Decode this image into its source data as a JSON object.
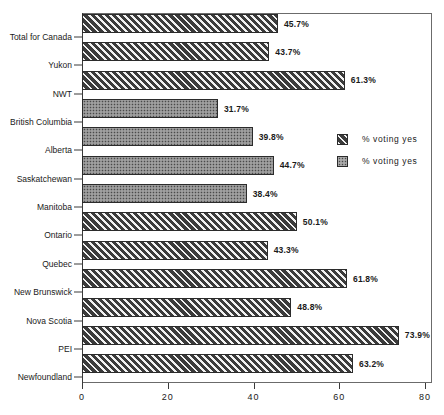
{
  "chart_data": {
    "type": "bar",
    "orientation": "horizontal",
    "title": "",
    "xlabel": "",
    "ylabel": "",
    "xlim": [
      0,
      80
    ],
    "xticks": [
      0,
      20,
      40,
      60,
      80
    ],
    "grid": false,
    "legend_position": "right-middle",
    "value_suffix": "%",
    "categories": [
      "Total for Canada",
      "Yukon",
      "NWT",
      "British Columbia",
      "Alberta",
      "Saskatchewan",
      "Manitoba",
      "Ontario",
      "Quebec",
      "New Brunswick",
      "Nova Scotia",
      "PEI",
      "Newfoundland"
    ],
    "values": [
      45.7,
      43.7,
      61.3,
      31.7,
      39.8,
      44.7,
      38.4,
      50.1,
      43.3,
      61.8,
      48.8,
      73.9,
      63.2
    ],
    "value_labels": [
      "45.7%",
      "43.7%",
      "61.3%",
      "31.7%",
      "39.8%",
      "44.7%",
      "38.4%",
      "50.1%",
      "43.3%",
      "61.8%",
      "48.8%",
      "73.9%",
      "63.2%"
    ],
    "patterns": [
      "hatch",
      "hatch",
      "hatch",
      "dots",
      "dots",
      "dots",
      "dots",
      "hatch",
      "hatch",
      "hatch",
      "hatch",
      "hatch",
      "hatch"
    ],
    "legend": [
      {
        "pattern": "hatch",
        "label": "% voting yes"
      },
      {
        "pattern": "dots",
        "label": "% voting yes"
      }
    ],
    "xtick_labels": [
      "0",
      "20",
      "40",
      "60",
      "80"
    ]
  }
}
